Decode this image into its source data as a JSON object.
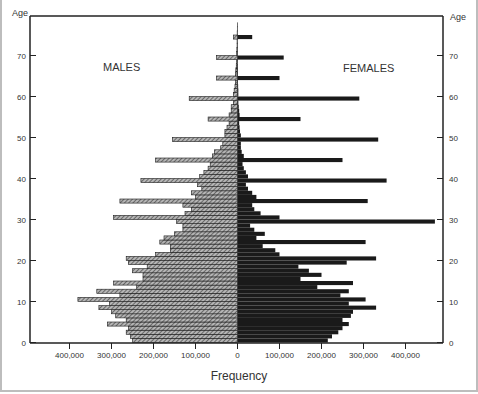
{
  "chart_data": {
    "type": "bar",
    "subtype": "population-pyramid",
    "title": "",
    "xlabel": "Frequency",
    "ylabel": "Age",
    "left_label": "MALES",
    "right_label": "FEMALES",
    "xlim": [
      -480000,
      480000
    ],
    "ylim": [
      0,
      78
    ],
    "x_ticks": [
      -400000,
      -300000,
      -200000,
      -100000,
      0,
      100000,
      200000,
      300000,
      400000
    ],
    "x_tick_labels": [
      "400,000",
      "300,000",
      "200,000",
      "100,000",
      "0",
      "100,000",
      "200,000",
      "300,000",
      "400,000"
    ],
    "y_ticks": [
      0,
      10,
      20,
      30,
      40,
      50,
      60,
      70
    ],
    "y_tick_labels": [
      "0",
      "10",
      "20",
      "30",
      "40",
      "50",
      "60",
      "70"
    ],
    "grid": false,
    "categories": [
      0,
      1,
      2,
      3,
      4,
      5,
      6,
      7,
      8,
      9,
      10,
      11,
      12,
      13,
      14,
      15,
      16,
      17,
      18,
      19,
      20,
      21,
      22,
      23,
      24,
      25,
      26,
      27,
      28,
      29,
      30,
      31,
      32,
      33,
      34,
      35,
      36,
      37,
      38,
      39,
      40,
      41,
      42,
      43,
      44,
      45,
      46,
      47,
      48,
      49,
      50,
      51,
      52,
      53,
      54,
      55,
      56,
      57,
      58,
      59,
      60,
      61,
      62,
      63,
      64,
      65,
      66,
      67,
      68,
      69,
      70,
      71,
      72,
      73,
      74,
      75,
      76,
      77
    ],
    "series": [
      {
        "name": "MALES",
        "values": [
          250000,
          255000,
          265000,
          260000,
          310000,
          265000,
          290000,
          300000,
          330000,
          305000,
          380000,
          280000,
          335000,
          240000,
          295000,
          225000,
          225000,
          250000,
          215000,
          260000,
          265000,
          195000,
          160000,
          160000,
          185000,
          175000,
          150000,
          130000,
          130000,
          145000,
          295000,
          125000,
          110000,
          130000,
          280000,
          100000,
          110000,
          85000,
          95000,
          230000,
          90000,
          80000,
          70000,
          65000,
          195000,
          60000,
          55000,
          40000,
          35000,
          155000,
          30000,
          30000,
          25000,
          20000,
          70000,
          20000,
          15000,
          15000,
          10000,
          115000,
          10000,
          8000,
          6000,
          5000,
          50000,
          5000,
          4000,
          3000,
          2000,
          50000,
          2000,
          1500,
          1000,
          1000,
          10000,
          800,
          500,
          300
        ]
      },
      {
        "name": "FEMALES",
        "values": [
          215000,
          225000,
          240000,
          250000,
          265000,
          250000,
          270000,
          275000,
          330000,
          265000,
          305000,
          245000,
          265000,
          190000,
          275000,
          150000,
          200000,
          170000,
          145000,
          260000,
          330000,
          100000,
          90000,
          60000,
          305000,
          45000,
          65000,
          40000,
          30000,
          470000,
          100000,
          55000,
          40000,
          35000,
          310000,
          45000,
          35000,
          25000,
          20000,
          355000,
          25000,
          20000,
          15000,
          12000,
          250000,
          15000,
          10000,
          8000,
          8000,
          335000,
          8000,
          6000,
          5000,
          4000,
          150000,
          5000,
          4000,
          3000,
          2000,
          290000,
          2000,
          2000,
          1500,
          1000,
          100000,
          1000,
          1000,
          800,
          500,
          110000,
          500,
          400,
          300,
          200,
          35000,
          200,
          100,
          50
        ]
      }
    ],
    "colors": {
      "males_fill": "#8c8c8c",
      "males_outline": "#1a1a1a",
      "females_fill": "#1a1a1a",
      "axis": "#222222"
    }
  }
}
